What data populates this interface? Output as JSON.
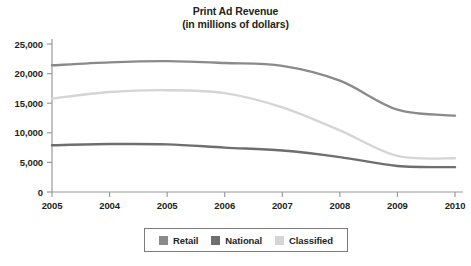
{
  "chart_data": {
    "type": "line",
    "title": "Print Ad Revenue",
    "subtitle": "(in millions of dollars)",
    "xlabel": "",
    "ylabel": "",
    "categories": [
      "2005",
      "2004",
      "2005",
      "2006",
      "2007",
      "2008",
      "2009",
      "2010"
    ],
    "ylim": [
      0,
      25000
    ],
    "ytick_values": [
      0,
      5000,
      10000,
      15000,
      20000,
      25000
    ],
    "ytick_labels": [
      "0",
      "5,000",
      "10,000",
      "15,000",
      "20,000",
      "25,000"
    ],
    "grid": false,
    "legend_position": "bottom",
    "series": [
      {
        "name": "Retail",
        "color": "#8a8a8a",
        "values": [
          21400,
          21900,
          22100,
          21800,
          21300,
          18800,
          13900,
          12900
        ]
      },
      {
        "name": "National",
        "color": "#6e6e6e",
        "values": [
          7900,
          8100,
          8050,
          7500,
          7000,
          5900,
          4400,
          4200
        ]
      },
      {
        "name": "Classified",
        "color": "#d5d5d5",
        "values": [
          15800,
          16900,
          17200,
          16700,
          14300,
          10400,
          6100,
          5700
        ]
      }
    ]
  },
  "legend": {
    "items": [
      {
        "label": "Retail",
        "color": "#8a8a8a"
      },
      {
        "label": "National",
        "color": "#6e6e6e"
      },
      {
        "label": "Classified",
        "color": "#d5d5d5"
      }
    ]
  },
  "axes": {
    "axis_color": "#9a9a9a",
    "tick_color": "#9a9a9a"
  }
}
